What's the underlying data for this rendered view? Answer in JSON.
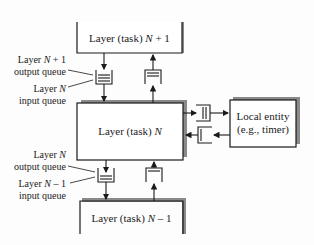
{
  "diagram": {
    "boxes": {
      "top": {
        "pre": "Layer (task) ",
        "var": "N",
        "post": " + 1"
      },
      "middle": {
        "pre": "Layer (task) ",
        "var": "N",
        "post": ""
      },
      "bottom": {
        "pre": "Layer (task) ",
        "var": "N",
        "post": " – 1"
      },
      "local": {
        "line1": "Local entity",
        "line2": "(e.g., timer)"
      }
    },
    "labels": {
      "upper_output": {
        "pre": "Layer ",
        "var": "N",
        "post": " + 1",
        "line2": "output queue"
      },
      "upper_input": {
        "pre": "Layer ",
        "var": "N",
        "post": "",
        "line2": "input queue"
      },
      "lower_output": {
        "pre": "Layer ",
        "var": "N",
        "post": "",
        "line2": "output queue"
      },
      "lower_input": {
        "pre": "Layer ",
        "var": "N",
        "post": " – 1",
        "line2": "input queue"
      }
    },
    "colors": {
      "line": "#1a1a1a",
      "shadow": "#8a8a8a",
      "background": "#fdfdfd"
    }
  }
}
